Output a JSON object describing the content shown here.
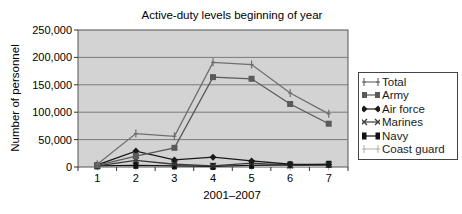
{
  "chart_data": {
    "type": "line",
    "title": "Active-duty levels beginning of year",
    "xlabel": "2001–2007",
    "ylabel": "Number of personnel",
    "categories": [
      "1",
      "2",
      "3",
      "4",
      "5",
      "6",
      "7"
    ],
    "ylim": [
      0,
      250000
    ],
    "yticks": [
      "0",
      "50,000",
      "100,000",
      "150,000",
      "200,000",
      "250,000"
    ],
    "grid": true,
    "legend_position": "right",
    "series": [
      {
        "name": "Total",
        "values": [
          5000,
          61000,
          56000,
          191000,
          187000,
          135000,
          97000
        ],
        "color": "#6e6e6e",
        "marker": "plus"
      },
      {
        "name": "Army",
        "values": [
          3000,
          20000,
          35000,
          164000,
          161000,
          115000,
          79000
        ],
        "color": "#5a5a5a",
        "marker": "square"
      },
      {
        "name": "Air force",
        "values": [
          4000,
          29000,
          13000,
          18000,
          11000,
          5000,
          4000
        ],
        "color": "#1a1a1a",
        "marker": "diamond"
      },
      {
        "name": "Marines",
        "values": [
          2000,
          12000,
          5000,
          2000,
          7000,
          3000,
          4000
        ],
        "color": "#3a3a3a",
        "marker": "x"
      },
      {
        "name": "Navy",
        "values": [
          2000,
          3000,
          2000,
          1000,
          3000,
          4000,
          5000
        ],
        "color": "#111111",
        "marker": "bar"
      },
      {
        "name": "Coast guard",
        "values": [
          1000,
          1000,
          1000,
          1000,
          1000,
          1000,
          1000
        ],
        "color": "#bdbdbd",
        "marker": "plus"
      }
    ]
  }
}
